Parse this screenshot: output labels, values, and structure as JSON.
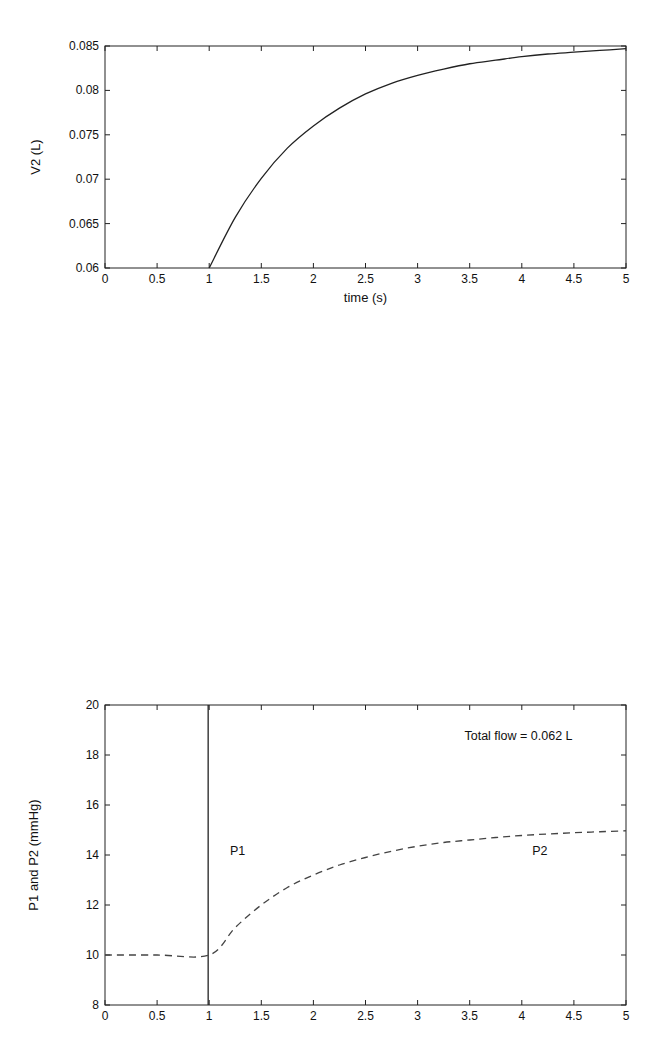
{
  "chart_data": [
    {
      "type": "line",
      "title": "",
      "xlabel": "time (s)",
      "ylabel": "V2 (L)",
      "xlim": [
        0,
        5
      ],
      "ylim": [
        0.06,
        0.085
      ],
      "xticks": [
        0,
        0.5,
        1,
        1.5,
        2,
        2.5,
        3,
        3.5,
        4,
        4.5,
        5
      ],
      "xtick_labels": [
        "0",
        "0.5",
        "1",
        "1.5",
        "2",
        "2.5",
        "3",
        "3.5",
        "4",
        "4.5",
        "5"
      ],
      "yticks": [
        0.06,
        0.065,
        0.07,
        0.075,
        0.08,
        0.085
      ],
      "ytick_labels": [
        "0.06",
        "0.065",
        "0.07",
        "0.075",
        "0.08",
        "0.085"
      ],
      "grid": false,
      "legend": null,
      "series": [
        {
          "name": "V2",
          "style": "solid",
          "color": "#222222",
          "x": [
            1.0,
            1.25,
            1.5,
            1.75,
            2.0,
            2.25,
            2.5,
            2.75,
            3.0,
            3.25,
            3.5,
            3.75,
            4.0,
            4.25,
            4.5,
            4.75,
            5.0
          ],
          "y": [
            0.06,
            0.0657,
            0.0701,
            0.0735,
            0.076,
            0.078,
            0.0796,
            0.0808,
            0.0817,
            0.0824,
            0.083,
            0.0834,
            0.0838,
            0.0841,
            0.0843,
            0.0845,
            0.0847
          ]
        }
      ]
    },
    {
      "type": "line",
      "title": "",
      "xlabel": "",
      "ylabel": "P1 and P2 (mmHg)",
      "xlim": [
        0,
        5
      ],
      "ylim": [
        8,
        20
      ],
      "xticks": [
        0,
        0.5,
        1,
        1.5,
        2,
        2.5,
        3,
        3.5,
        4,
        4.5,
        5
      ],
      "xtick_labels": [
        "0",
        "0.5",
        "1",
        "1.5",
        "2",
        "2.5",
        "3",
        "3.5",
        "4",
        "4.5",
        "5"
      ],
      "yticks": [
        8,
        10,
        12,
        14,
        16,
        18,
        20
      ],
      "ytick_labels": [
        "8",
        "10",
        "12",
        "14",
        "16",
        "18",
        "20"
      ],
      "grid": false,
      "legend": null,
      "annotations": [
        {
          "text": "Total flow = 0.062 L",
          "x": 3.45,
          "y": 18.6
        },
        {
          "text": "P1",
          "x": 1.2,
          "y": 14.0
        },
        {
          "text": "P2",
          "x": 4.1,
          "y": 14.0
        }
      ],
      "series": [
        {
          "name": "P1",
          "style": "solid",
          "color": "#222222",
          "x": [
            0.99,
            0.99
          ],
          "y": [
            8,
            20
          ]
        },
        {
          "name": "P2",
          "style": "dashed",
          "color": "#444444",
          "x": [
            0.0,
            0.5,
            1.0,
            1.25,
            1.5,
            1.75,
            2.0,
            2.25,
            2.5,
            2.75,
            3.0,
            3.25,
            3.5,
            3.75,
            4.0,
            4.25,
            4.5,
            4.75,
            5.0
          ],
          "y": [
            10.0,
            10.0,
            10.0,
            11.1,
            12.0,
            12.7,
            13.2,
            13.6,
            13.9,
            14.15,
            14.35,
            14.5,
            14.6,
            14.7,
            14.78,
            14.84,
            14.89,
            14.93,
            14.97
          ]
        }
      ]
    }
  ]
}
